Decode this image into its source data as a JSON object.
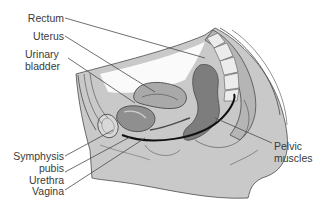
{
  "diagram": {
    "colors": {
      "background": "#ffffff",
      "tissue_light": "#c9c9c9",
      "tissue_mid": "#a9a9a9",
      "tissue_dark": "#7d7d7d",
      "outline": "#4a4a4a",
      "pelvic_muscle_line": "#111111",
      "vertebra_fill": "#ececec",
      "label_text": "#3a3a3a"
    },
    "labels": {
      "rectum": "Rectum",
      "uterus": "Uterus",
      "urinary_bladder_1": "Urinary",
      "urinary_bladder_2": "bladder",
      "symphysis_pubis_1": "Symphysis",
      "symphysis_pubis_2": "pubis",
      "urethra": "Urethra",
      "vagina": "Vagina",
      "pelvic_muscles_1": "Pelvic",
      "pelvic_muscles_2": "muscles"
    }
  }
}
